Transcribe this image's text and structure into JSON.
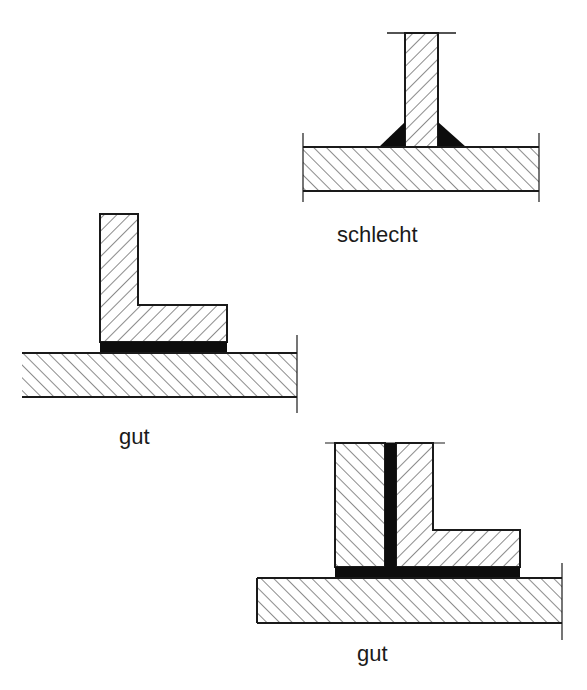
{
  "diagram": {
    "type": "joint-comparison",
    "colors": {
      "line": "#1a1a1a",
      "adhesive": "#0d0d0d",
      "background": "#ffffff"
    },
    "figures": [
      {
        "id": "t-joint-fillet",
        "label": "schlecht",
        "description": "T-joint with web plate on base plate, triangular fillet welds/adhesive at root"
      },
      {
        "id": "angle-on-plate",
        "label": "gut",
        "description": "L-profile bonded flat onto base plate with continuous adhesive layer"
      },
      {
        "id": "double-angle",
        "label": "gut",
        "description": "Web plate between L-profile and block, bonded with vertical and horizontal adhesive layers on base plate"
      }
    ]
  },
  "labels": {
    "top": "schlecht",
    "middle": "gut",
    "bottom": "gut"
  }
}
